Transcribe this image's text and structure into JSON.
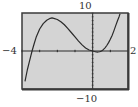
{
  "chart_data": {
    "type": "line",
    "title": "",
    "xlabel": "",
    "ylabel": "",
    "window": {
      "xmin": -4,
      "xmax": 2,
      "ymin": -10,
      "ymax": 10,
      "xscl": 1,
      "yscl": 1
    },
    "tick_labels": {
      "xmin": "−4",
      "xmax": "2",
      "ymin": "−10",
      "ymax": "10"
    },
    "grid": false,
    "series": [
      {
        "name": "f(x)",
        "x": [
          -3.83,
          -3.7,
          -3.6,
          -3.5,
          -3.43,
          -3.3,
          -3.2,
          -3.0,
          -2.8,
          -2.6,
          -2.4,
          -2.3,
          -2.2,
          -2.0,
          -1.8,
          -1.6,
          -1.4,
          -1.2,
          -1.0,
          -0.8,
          -0.6,
          -0.4,
          -0.2,
          0.0,
          0.1,
          0.2,
          0.3,
          0.4,
          0.5,
          0.6,
          0.7,
          0.8,
          0.9,
          1.0,
          1.1,
          1.2,
          1.3,
          1.4,
          1.5,
          1.55
        ],
        "values": [
          -8.0,
          -5.0,
          -3.1,
          -1.3,
          0.0,
          2.1,
          3.6,
          5.8,
          7.2,
          8.1,
          8.6,
          8.7,
          8.6,
          8.3,
          7.7,
          6.9,
          5.9,
          4.8,
          3.7,
          2.6,
          1.6,
          0.8,
          0.26,
          0.0,
          -0.14,
          -0.25,
          -0.27,
          -0.2,
          0.0,
          0.35,
          0.83,
          1.45,
          2.2,
          3.1,
          4.1,
          5.3,
          6.6,
          7.9,
          9.1,
          9.8
        ]
      }
    ],
    "annotations": []
  },
  "colors": {
    "screen_background": "#d4d4d4",
    "frame": "#3a3a3a",
    "axes": "#2a2a2a",
    "curve": "#2a2a2a",
    "labels": "#333333"
  }
}
